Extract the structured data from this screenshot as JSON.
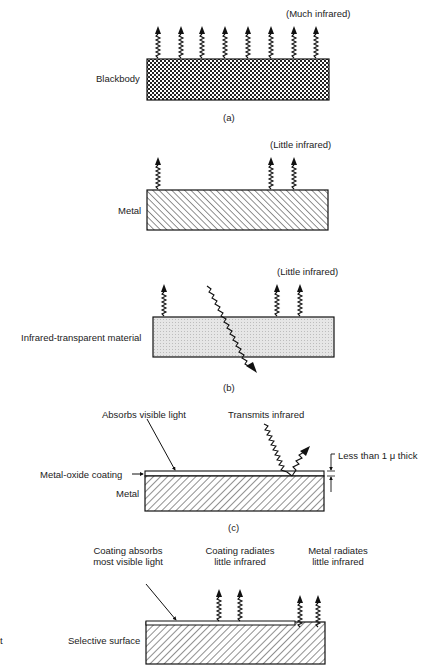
{
  "figure": {
    "panel_a": {
      "caption": "(a)",
      "body_label": "Blackbody",
      "emission_label": "(Much infrared)",
      "emission_arrow_count": 8,
      "fill": "cross-hatch"
    },
    "panel_b": {
      "caption": "(b)",
      "metal": {
        "body_label": "Metal",
        "emission_label": "(Little infrared)",
        "emission_arrow_count": 3,
        "fill": "diagonal-hatch"
      },
      "transparent": {
        "body_label": "Infrared-transparent material",
        "emission_label": "(Little infrared)",
        "emission_arrow_count": 3,
        "transmitted_ray": "infrared passes through",
        "fill": "light-stipple"
      }
    },
    "panel_c": {
      "caption": "(c)",
      "absorbs_label": "Absorbs visible light",
      "transmits_label": "Transmits infrared",
      "thickness_label": "Less than 1 μ thick",
      "coating_label": "Metal-oxide coating",
      "metal_label": "Metal"
    },
    "panel_d": {
      "coating_absorbs_label_line1": "Coating absorbs",
      "coating_absorbs_label_line2": "most visible light",
      "coating_radiates_label_line1": "Coating radiates",
      "coating_radiates_label_line2": "little infrared",
      "metal_radiates_label_line1": "Metal radiates",
      "metal_radiates_label_line2": "little infrared",
      "body_label": "Selective surface"
    },
    "edge_fragment": "t",
    "colors": {
      "ink": "#1a1a1a",
      "paper": "#ffffff",
      "stipple": "#d8d8d8"
    }
  }
}
